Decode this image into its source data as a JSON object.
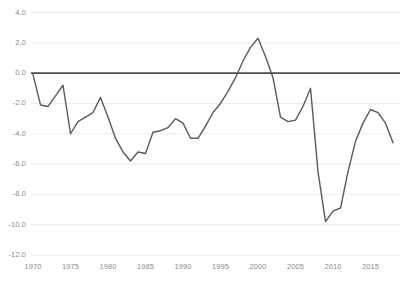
{
  "chart_data": {
    "type": "line",
    "title": "",
    "subtitle": "",
    "xlabel": "",
    "ylabel": "",
    "xlim": [
      1970,
      2018
    ],
    "ylim": [
      -12.0,
      4.0
    ],
    "grid": true,
    "legend": null,
    "zero_line": 0.0,
    "line_color": "#5a5a5a",
    "grid_color": "#eceaea",
    "zero_line_color": "#4d4d4d",
    "tick_label_color": "#8c8c8c",
    "background_color": "#ffffff",
    "ytick_labels": [
      "4.0",
      "2.0",
      "0.0",
      "-2.0",
      "-4.0",
      "-6.0",
      "-8.0",
      "-10.0",
      "-12.0"
    ],
    "ytick_values": [
      4.0,
      2.0,
      0.0,
      -2.0,
      -4.0,
      -6.0,
      -8.0,
      -10.0,
      -12.0
    ],
    "xtick_labels": [
      "1970",
      "1975",
      "1980",
      "1985",
      "1990",
      "1995",
      "2000",
      "2005",
      "2010",
      "2015"
    ],
    "xtick_values": [
      1970,
      1975,
      1980,
      1985,
      1990,
      1995,
      2000,
      2005,
      2010,
      2015
    ],
    "x": [
      1970,
      1971,
      1972,
      1973,
      1974,
      1975,
      1976,
      1977,
      1978,
      1979,
      1980,
      1981,
      1982,
      1983,
      1984,
      1985,
      1986,
      1987,
      1988,
      1989,
      1990,
      1991,
      1992,
      1993,
      1994,
      1995,
      1996,
      1997,
      1998,
      1999,
      2000,
      2001,
      2002,
      2003,
      2004,
      2005,
      2006,
      2007,
      2008,
      2009,
      2010,
      2011,
      2012,
      2013,
      2014,
      2015,
      2016,
      2017,
      2018
    ],
    "values": [
      -0.1,
      -2.1,
      -2.2,
      -1.5,
      -0.8,
      -4.0,
      -3.2,
      -2.9,
      -2.6,
      -1.6,
      -2.9,
      -4.3,
      -5.2,
      -5.8,
      -5.2,
      -5.3,
      -3.9,
      -3.8,
      -3.6,
      -3.0,
      -3.3,
      -4.3,
      -4.3,
      -3.5,
      -2.6,
      -2.0,
      -1.2,
      -0.3,
      0.8,
      1.7,
      2.3,
      1.1,
      -0.3,
      -2.9,
      -3.2,
      -3.1,
      -2.2,
      -1.0,
      -6.5,
      -9.8,
      -9.1,
      -8.9,
      -6.5,
      -4.5,
      -3.3,
      -2.4,
      -2.6,
      -3.3,
      -4.6
    ],
    "series": [
      {
        "name": "series-1",
        "values": [
          -0.1,
          -2.1,
          -2.2,
          -1.5,
          -0.8,
          -4.0,
          -3.2,
          -2.9,
          -2.6,
          -1.6,
          -2.9,
          -4.3,
          -5.2,
          -5.8,
          -5.2,
          -5.3,
          -3.9,
          -3.8,
          -3.6,
          -3.0,
          -3.3,
          -4.3,
          -4.3,
          -3.5,
          -2.6,
          -2.0,
          -1.2,
          -0.3,
          0.8,
          1.7,
          2.3,
          1.1,
          -0.3,
          -2.9,
          -3.2,
          -3.1,
          -2.2,
          -1.0,
          -6.5,
          -9.8,
          -9.1,
          -8.9,
          -6.5,
          -4.5,
          -3.3,
          -2.4,
          -2.6,
          -3.3,
          -4.6
        ]
      }
    ]
  }
}
